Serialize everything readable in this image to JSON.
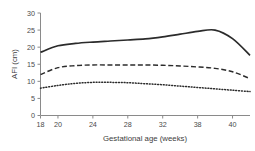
{
  "chart_data": {
    "type": "line",
    "title": "",
    "xlabel": "Gestational age (weeks)",
    "ylabel": "AFI (cm)",
    "xlim": [
      18,
      42
    ],
    "ylim": [
      0,
      30
    ],
    "xticks": [
      18,
      20,
      24,
      28,
      32,
      36,
      40
    ],
    "xtick_labels": [
      "18",
      "20",
      "24",
      "28",
      "32",
      "38",
      "40"
    ],
    "yticks": [
      0,
      5,
      10,
      15,
      20,
      25,
      30
    ],
    "ytick_labels": [
      "0",
      "5",
      "10",
      "15",
      "20",
      "25",
      "30"
    ],
    "grid": false,
    "legend": "none",
    "x": [
      18,
      20,
      22,
      24,
      26,
      28,
      30,
      32,
      34,
      36,
      38,
      40,
      42
    ],
    "series": [
      {
        "name": "Upper percentile",
        "style": "solid",
        "color": "#2b2b2b",
        "values": [
          18.5,
          20.4,
          21.1,
          21.5,
          21.8,
          22.1,
          22.4,
          23.0,
          23.8,
          24.6,
          25.0,
          22.5,
          17.6
        ]
      },
      {
        "name": "Median",
        "style": "dashed",
        "color": "#2b2b2b",
        "values": [
          12.0,
          14.0,
          14.6,
          14.8,
          14.8,
          14.8,
          14.8,
          14.7,
          14.5,
          14.2,
          13.8,
          12.8,
          10.8
        ]
      },
      {
        "name": "Lower percentile",
        "style": "dotted",
        "color": "#2b2b2b",
        "values": [
          8.0,
          8.8,
          9.4,
          9.7,
          9.7,
          9.6,
          9.3,
          9.0,
          8.6,
          8.2,
          7.8,
          7.4,
          7.0
        ]
      }
    ]
  },
  "axes": {
    "x_title": "Gestational age (weeks)",
    "y_title": "AFI (cm)"
  },
  "caption": ""
}
